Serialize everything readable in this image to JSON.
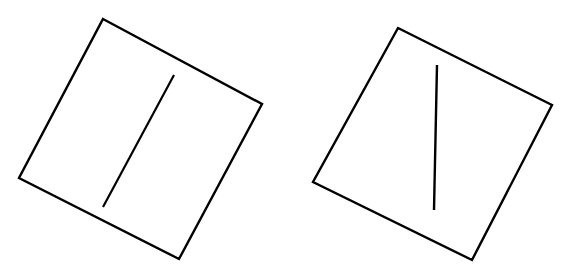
{
  "figure": {
    "background_color": "#ffffff",
    "stroke_color": "#000000",
    "canvas": {
      "width": 573,
      "height": 273
    },
    "panels": [
      {
        "id": "left-panel",
        "name": "left-tilted-square-with-oblique-rod",
        "frame": {
          "name": "left-square-frame",
          "shape": "square",
          "stroke_width": 2.4,
          "rotation_degrees": -28,
          "points": "103,19 262,104 179,259 19,178",
          "corners": [
            {
              "label": "top",
              "x": 103,
              "y": 19
            },
            {
              "label": "right",
              "x": 262,
              "y": 104
            },
            {
              "label": "bottom",
              "x": 179,
              "y": 259
            },
            {
              "label": "left",
              "x": 19,
              "y": 178
            }
          ]
        },
        "rod": {
          "name": "left-inner-rod",
          "shape": "line",
          "stroke_width": 2.2,
          "tilt_degrees": -28,
          "x1": 174,
          "y1": 75,
          "x2": 103,
          "y2": 207
        }
      },
      {
        "id": "right-panel",
        "name": "right-tilted-square-with-vertical-rod",
        "frame": {
          "name": "right-square-frame",
          "shape": "square",
          "stroke_width": 2.4,
          "rotation_degrees": -28,
          "points": "398,28 552,105 472,260 313,182",
          "corners": [
            {
              "label": "top",
              "x": 398,
              "y": 28
            },
            {
              "label": "right",
              "x": 552,
              "y": 105
            },
            {
              "label": "bottom",
              "x": 472,
              "y": 260
            },
            {
              "label": "left",
              "x": 313,
              "y": 182
            }
          ]
        },
        "rod": {
          "name": "right-inner-rod",
          "shape": "line",
          "stroke_width": 2.4,
          "tilt_degrees": 1,
          "x1": 437,
          "y1": 65,
          "x2": 434,
          "y2": 210
        }
      }
    ]
  }
}
